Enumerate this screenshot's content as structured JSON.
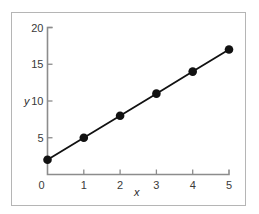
{
  "chart_data": {
    "type": "line",
    "title": "",
    "xlabel": "x",
    "ylabel": "y",
    "x": [
      0,
      1,
      2,
      3,
      4,
      5
    ],
    "series": [
      {
        "name": "y",
        "values": [
          2,
          5,
          8,
          11,
          14,
          17
        ],
        "color": "#111111",
        "markers": true
      }
    ],
    "xlim": [
      0,
      5
    ],
    "ylim": [
      0,
      20
    ],
    "xticks": [
      "0",
      "1",
      "2",
      "3",
      "4",
      "5"
    ],
    "yticks": [
      "5",
      "10",
      "15",
      "20"
    ],
    "grid": false,
    "legend": null
  },
  "labels": {
    "x_axis": "x",
    "y_axis": "y"
  }
}
